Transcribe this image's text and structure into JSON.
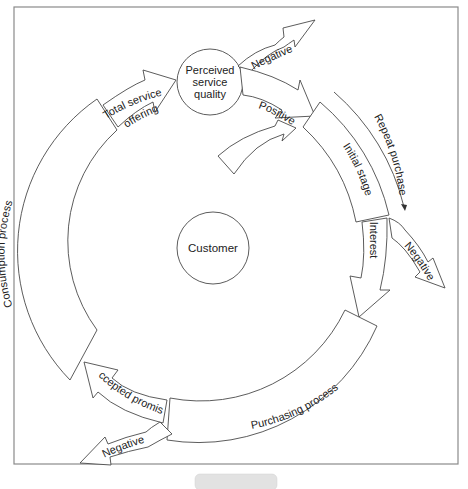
{
  "diagram": {
    "center_node": {
      "label": "Customer"
    },
    "quality_node": {
      "lines": [
        "Perceived",
        "service",
        "quality"
      ]
    },
    "stages": {
      "initial_stage": "Initial stage",
      "purchasing_process": "Purchasing process",
      "consumption_process": "Consumption process"
    },
    "arrows": {
      "interest": "Interest",
      "accepted_promise": "Accepted promise",
      "total_service_offering": [
        "Total service",
        "offering"
      ],
      "positive": "Positive",
      "negative_top": "Negative",
      "negative_right": "Negative",
      "negative_bottom": "Negative",
      "repeat_purchase": "Repeat purchase"
    },
    "colors": {
      "stroke": "#4a4a4a",
      "frame": "#8a8a8a",
      "text": "#222222",
      "background": "#ffffff"
    }
  }
}
